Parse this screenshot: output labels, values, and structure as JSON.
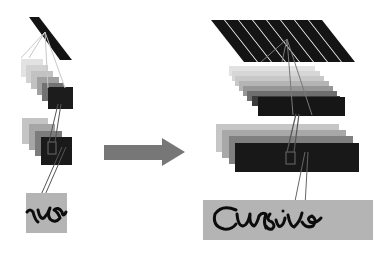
{
  "diagram": {
    "type": "receptive-field-scaling",
    "left_network": {
      "input_text": "rsi",
      "input_box_color": "#b4b4b4",
      "layers": [
        {
          "name": "filter",
          "stripes": 1,
          "color": "#141414"
        },
        {
          "name": "feature-stack-1",
          "count": 6,
          "colors": [
            "#e0e0e0",
            "#cfcfcf",
            "#bdbdbd",
            "#9a9a9a",
            "#6a6a6a",
            "#1e1e1e"
          ]
        },
        {
          "name": "feature-stack-2",
          "count": 4,
          "colors": [
            "#c4c4c4",
            "#a6a6a6",
            "#7a7a7a",
            "#1a1a1a"
          ]
        }
      ]
    },
    "arrow": {
      "color": "#777777",
      "direction": "right"
    },
    "right_network": {
      "input_text": "Cursive",
      "input_box_color": "#b4b4b4",
      "layers": [
        {
          "name": "filter",
          "stripes": 8,
          "color": "#141414"
        },
        {
          "name": "feature-stack-1",
          "count": 8,
          "colors": [
            "#e2e2e2",
            "#d6d6d6",
            "#c8c8c8",
            "#b4b4b4",
            "#969696",
            "#6e6e6e",
            "#3c3c3c",
            "#161616"
          ]
        },
        {
          "name": "feature-stack-2",
          "count": 4,
          "colors": [
            "#c6c6c6",
            "#a8a8a8",
            "#808080",
            "#181818"
          ]
        }
      ]
    }
  }
}
